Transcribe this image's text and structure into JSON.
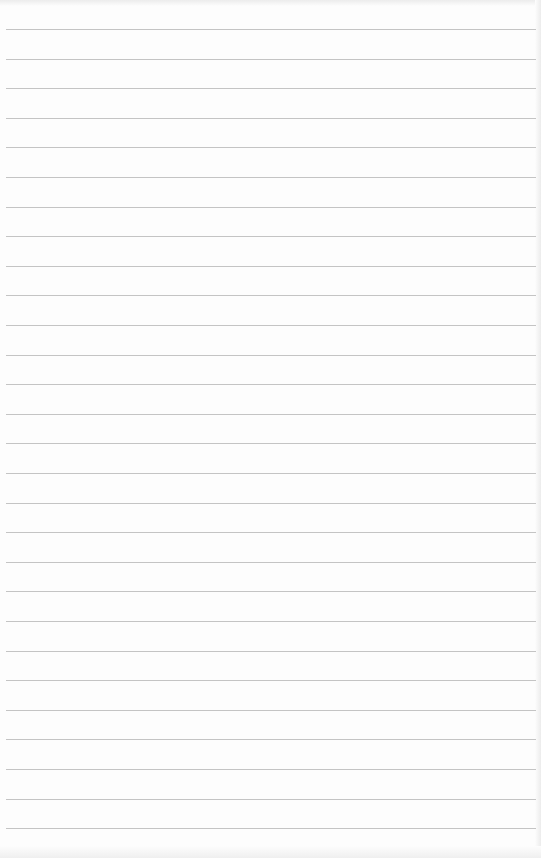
{
  "page": {
    "type": "lined-paper",
    "background_color": "#fdfdfd",
    "line_color": "#c4c4c4",
    "line_count": 28,
    "first_line_y": 29,
    "line_spacing": 29.6
  }
}
